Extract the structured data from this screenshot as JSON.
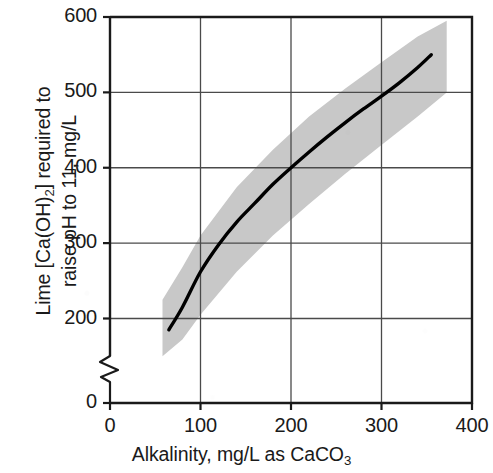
{
  "chart_data": {
    "type": "line",
    "title": "",
    "xlabel": "Alkalinity, mg/L as CaCO3",
    "xlabel_parts": {
      "main": "Alkalinity, mg/L as CaCO",
      "sub": "3"
    },
    "ylabel": "Lime [Ca(OH)2] required to raise pH to 11, mg/L",
    "ylabel_line1_parts": {
      "a": "Lime [Ca(OH)",
      "sub": "2",
      "b": "] required to"
    },
    "ylabel_line2": "raise pH to 11, mg/L",
    "xlim": [
      0,
      400
    ],
    "ylim": [
      0,
      600
    ],
    "y_axis_break": true,
    "y_break_between": [
      0,
      200
    ],
    "grid": true,
    "legend": "none",
    "xticks": [
      "0",
      "100",
      "200",
      "300",
      "400"
    ],
    "xtick_values": [
      0,
      100,
      200,
      300,
      400
    ],
    "yticks": [
      "0",
      "200",
      "300",
      "400",
      "500",
      "600"
    ],
    "ytick_values": [
      0,
      200,
      300,
      400,
      500,
      600
    ],
    "series": [
      {
        "name": "Lime dose curve",
        "color": "#000000",
        "x": [
          65,
          80,
          100,
          120,
          140,
          160,
          180,
          200,
          220,
          240,
          260,
          280,
          300,
          320,
          340,
          355
        ],
        "values": [
          185,
          215,
          262,
          298,
          328,
          353,
          378,
          400,
          421,
          441,
          460,
          478,
          495,
          513,
          533,
          550
        ]
      }
    ],
    "band": {
      "name": "Uncertainty band",
      "color": "#c8c8c8",
      "x": [
        58,
        80,
        100,
        140,
        180,
        220,
        260,
        300,
        340,
        372
      ],
      "upper": [
        225,
        268,
        310,
        374,
        424,
        468,
        505,
        540,
        574,
        595
      ],
      "lower": [
        150,
        172,
        205,
        262,
        310,
        352,
        392,
        430,
        468,
        500
      ]
    },
    "annotations": []
  },
  "figure": {
    "plot_frame_color": "#1a1a1a",
    "grid_color": "#4a4a4a",
    "background": "#ffffff"
  }
}
